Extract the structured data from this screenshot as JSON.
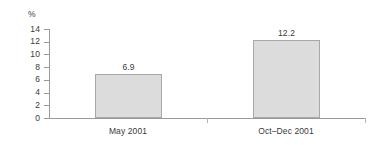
{
  "chart_data": {
    "type": "bar",
    "title": "",
    "xlabel": "",
    "ylabel": "%",
    "categories": [
      "May 2001",
      "Oct–Dec 2001"
    ],
    "values": [
      6.9,
      12.2
    ],
    "value_labels": [
      "6.9",
      "12.2"
    ],
    "ylim": [
      0,
      14
    ],
    "ytick_step": 2,
    "yticks": [
      0,
      2,
      4,
      6,
      8,
      10,
      12,
      14
    ],
    "ytick_labels": [
      "0",
      "2",
      "4",
      "6",
      "8",
      "10",
      "12",
      "14"
    ],
    "grid": false,
    "legend": null,
    "bar_fill_color": "#dcdcdc",
    "bar_border_color": "#a8a8a8",
    "axis_color": "#9a9a9a",
    "text_color": "#3a3a3a"
  }
}
